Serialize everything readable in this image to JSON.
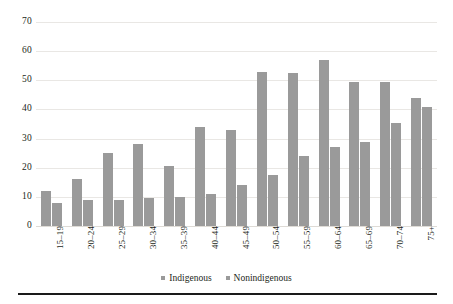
{
  "chart_data": {
    "type": "bar",
    "title": "",
    "subtitle": "",
    "xlabel": "",
    "ylabel": "",
    "categories": [
      "15–19",
      "20–24",
      "25–29",
      "30–34",
      "35–39",
      "40–44",
      "45–49",
      "50–54",
      "55–59",
      "60–64",
      "65–69",
      "70–74",
      "75+"
    ],
    "series": [
      {
        "name": "Indigenous",
        "color": "#9a9a9a",
        "values": [
          12,
          16,
          25,
          28,
          20.5,
          34,
          33,
          53,
          52.5,
          57,
          49.5,
          49.5,
          44
        ]
      },
      {
        "name": "Nonindigenous",
        "color": "#9a9a9a",
        "values": [
          8,
          9,
          9,
          9.5,
          10,
          11,
          14,
          17.5,
          24,
          27,
          29,
          35.5,
          41
        ]
      }
    ],
    "ylim": [
      0,
      70
    ],
    "yticks": [
      0,
      10,
      20,
      30,
      40,
      50,
      60,
      70
    ],
    "ytick_labels": [
      "0",
      "10",
      "20",
      "30",
      "40",
      "50",
      "60",
      "70"
    ],
    "grid": true,
    "grid_axis": "y",
    "legend_position": "bottom-center",
    "bar_color": "#9a9a9a",
    "gridline_color": "#e9e7e4",
    "text_color": "#231f20",
    "background_color": "#ffffff"
  },
  "legend": {
    "entries": [
      {
        "label": "Indigenous",
        "marker": "square-marker"
      },
      {
        "label": "Nonindigenous",
        "marker": "square-marker"
      }
    ]
  },
  "footer": {
    "rule": "horizontal-rule"
  }
}
